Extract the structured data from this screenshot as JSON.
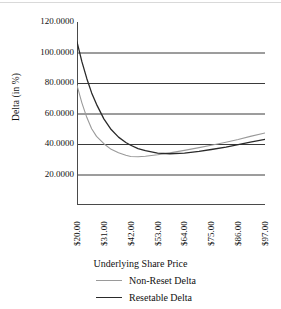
{
  "chart_data": {
    "type": "line",
    "title": "",
    "xlabel": "Underlying Share Price",
    "ylabel": "Delta (in %)",
    "xtick_labels": [
      "$20.00",
      "$31.00",
      "$42.00",
      "$53.00",
      "$64.00",
      "$75.00",
      "$86.00",
      "$97.00"
    ],
    "ytick_labels": [
      "120.0000",
      "100.0000",
      "80.0000",
      "60.0000",
      "40.0000",
      "20.0000"
    ],
    "ytick_values": [
      120,
      100,
      80,
      60,
      40,
      20
    ],
    "ylim": [
      0,
      120
    ],
    "xlim": [
      20,
      97
    ],
    "grid": "horizontal",
    "legend_position": "below",
    "series": [
      {
        "name": "Non-Reset Delta",
        "color": "#9a9a9a",
        "x": [
          20,
          22,
          24,
          26,
          28,
          31,
          34,
          37,
          40,
          42,
          45,
          48,
          53,
          58,
          64,
          70,
          75,
          81,
          86,
          91,
          97
        ],
        "values": [
          78.5,
          67.0,
          57.5,
          50.0,
          45.0,
          40.2,
          36.5,
          34.2,
          32.6,
          31.8,
          31.6,
          32.0,
          33.0,
          34.2,
          35.8,
          37.6,
          39.2,
          41.2,
          43.0,
          45.0,
          47.2
        ]
      },
      {
        "name": "Resetable Delta",
        "color": "#2a2a2a",
        "x": [
          20,
          22,
          24,
          26,
          28,
          31,
          34,
          37,
          40,
          42,
          45,
          48,
          53,
          58,
          64,
          70,
          75,
          81,
          86,
          91,
          97
        ],
        "values": [
          107.0,
          94.0,
          83.0,
          73.5,
          66.0,
          56.5,
          49.5,
          44.5,
          41.0,
          39.2,
          37.0,
          35.6,
          34.0,
          33.6,
          34.0,
          35.2,
          36.4,
          38.0,
          39.6,
          41.2,
          43.0
        ]
      }
    ]
  },
  "legend": {
    "items": [
      {
        "label": "Non-Reset Delta",
        "color": "#9a9a9a"
      },
      {
        "label": "Resetable Delta",
        "color": "#2a2a2a"
      }
    ]
  },
  "colors": {
    "gridline": "#3a3a3a",
    "axis": "#4a4a4a",
    "non_reset": "#9a9a9a",
    "resetable": "#2a2a2a",
    "background": "#ffffff"
  }
}
